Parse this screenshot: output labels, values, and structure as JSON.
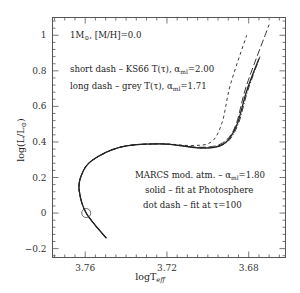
{
  "chart_data": {
    "type": "line",
    "title": "",
    "xlabel": "logT_eff",
    "ylabel": "log(L/L_sun)",
    "xlim": [
      3.776,
      3.662
    ],
    "ylim": [
      -0.25,
      1.1
    ],
    "x_inverted": true,
    "grid": false,
    "xticks": [
      "3.76",
      "3.72",
      "3.68"
    ],
    "yticks": [
      "-0.2",
      "0",
      "0.2",
      "0.4",
      "0.6",
      "0.8",
      "1"
    ],
    "annotations": {
      "model": "1M⊙, [M/H]=0.0",
      "short_dash": "short dash – KS66 T(τ), αml=2.00",
      "long_dash": "long dash – grey T(τ), αml=1.71",
      "marcs": "MARCS mod. atm. – αml=1.80",
      "solid": "solid – fit at Photosphere",
      "dot_dash": "dot dash – fit at τ=100"
    },
    "marker": {
      "label": "present Sun",
      "x": 3.7595,
      "y": 0.0
    },
    "series": [
      {
        "name": "solid - MARCS fit at Photosphere",
        "style": "solid",
        "x": [
          3.7497,
          3.7595,
          3.7629,
          3.762,
          3.757,
          3.7423,
          3.7227,
          3.7031,
          3.6923,
          3.686,
          3.681,
          3.675
        ],
        "y": [
          -0.141,
          0.0,
          0.124,
          0.208,
          0.293,
          0.372,
          0.389,
          0.366,
          0.389,
          0.49,
          0.687,
          0.868
        ]
      },
      {
        "name": "dot dash - MARCS fit at tau=100",
        "style": "dashdot",
        "x": [
          3.7497,
          3.7595,
          3.7629,
          3.762,
          3.757,
          3.7423,
          3.7227,
          3.7031,
          3.6918,
          3.6855,
          3.6805,
          3.6745
        ],
        "y": [
          -0.141,
          0.0,
          0.124,
          0.208,
          0.293,
          0.372,
          0.389,
          0.366,
          0.389,
          0.49,
          0.687,
          0.88
        ]
      },
      {
        "name": "long dash - grey T(tau), alpha=1.71",
        "style": "longdash",
        "x": [
          3.7497,
          3.7595,
          3.7629,
          3.762,
          3.757,
          3.7423,
          3.7227,
          3.7031,
          3.6928,
          3.6865,
          3.681,
          3.67
        ],
        "y": [
          -0.141,
          0.0,
          0.124,
          0.208,
          0.293,
          0.372,
          0.389,
          0.37,
          0.395,
          0.49,
          0.72,
          1.06
        ]
      },
      {
        "name": "short dash - KS66 T(tau), alpha=2.00",
        "style": "shortdash",
        "x": [
          3.7497,
          3.7595,
          3.7629,
          3.762,
          3.757,
          3.7423,
          3.7227,
          3.7081,
          3.6983,
          3.693,
          3.689,
          3.681
        ],
        "y": [
          -0.141,
          0.0,
          0.124,
          0.208,
          0.293,
          0.372,
          0.389,
          0.38,
          0.4,
          0.51,
          0.72,
          1.0
        ]
      }
    ]
  }
}
